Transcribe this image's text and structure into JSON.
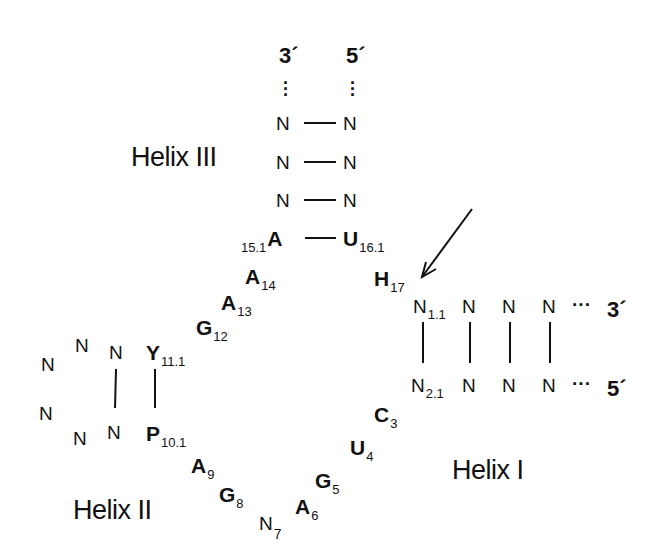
{
  "diagram": {
    "type": "hammerhead ribozyme secondary structure",
    "helix_labels": {
      "helix1": "Helix I",
      "helix2": "Helix II",
      "helix3": "Helix III"
    },
    "helix3": {
      "end_3prime": "3´",
      "end_5prime": "5´",
      "left": [
        "N",
        "N",
        "N"
      ],
      "right": [
        "N",
        "N",
        "N"
      ],
      "closing_left": {
        "base": "A",
        "index": "15.1"
      },
      "closing_right": {
        "base": "U",
        "index": "16.1"
      }
    },
    "core_upper": [
      {
        "base": "A",
        "index": "14"
      },
      {
        "base": "A",
        "index": "13"
      },
      {
        "base": "G",
        "index": "12"
      }
    ],
    "cleavage_site": {
      "base": "H",
      "index": "17"
    },
    "helix2": {
      "top_pair": {
        "base": "Y",
        "index": "11.1"
      },
      "bottom_pair": {
        "base": "P",
        "index": "10.1"
      },
      "loop": [
        "N",
        "N",
        "N",
        "N",
        "N",
        "N"
      ]
    },
    "core_lower": [
      {
        "base": "A",
        "index": "9"
      },
      {
        "base": "G",
        "index": "8"
      },
      {
        "base": "N",
        "index": "7"
      },
      {
        "base": "A",
        "index": "6"
      },
      {
        "base": "G",
        "index": "5"
      },
      {
        "base": "U",
        "index": "4"
      },
      {
        "base": "C",
        "index": "3"
      }
    ],
    "helix1": {
      "top_first": {
        "base": "N",
        "index": "1.1"
      },
      "bottom_first": {
        "base": "N",
        "index": "2.1"
      },
      "top": [
        "N",
        "N",
        "N"
      ],
      "bottom": [
        "N",
        "N",
        "N"
      ],
      "ellipsis": "···",
      "end_top": "3´",
      "end_bottom": "5´"
    }
  }
}
